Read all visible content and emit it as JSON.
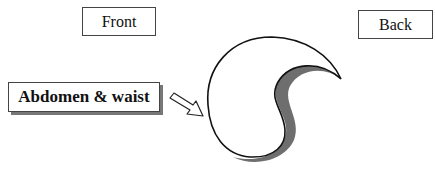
{
  "labels": {
    "front": "Front",
    "back": "Back",
    "region": "Abdomen & waist"
  },
  "colors": {
    "outline": "#111111",
    "shadow": "#6e6e6e"
  }
}
